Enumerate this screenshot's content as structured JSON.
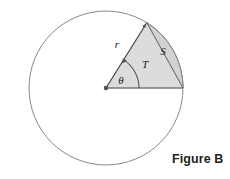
{
  "figure": {
    "caption": "Figure B",
    "caption_position": {
      "left": 172,
      "top": 152
    },
    "background_color": "#ffffff",
    "stroke_color": "#6e6e6e",
    "sector_fill_color": "#dcdcdc",
    "segment_fill_color": "#d2d2d2",
    "label_color": "#1a1a1a",
    "circle": {
      "name": "outer-circle",
      "center_x": 106,
      "center_y": 88,
      "radius": 77,
      "stroke_width": 0.9,
      "fill": "none"
    },
    "center_point": {
      "name": "circle-center-dot",
      "x": 106,
      "y": 88,
      "radius": 2.2
    },
    "sector": {
      "name": "shaded-sector",
      "start_angle_deg": 0,
      "end_angle_deg": 58,
      "apex_x": 146.8,
      "apex_y": 22.7,
      "arc_end_x": 183,
      "arc_end_y": 88
    },
    "labels": [
      {
        "id": "radius",
        "text": "r",
        "x": 120,
        "y": 46
      },
      {
        "id": "segment",
        "text": "S",
        "x": 163,
        "y": 52
      },
      {
        "id": "triangle",
        "text": "T",
        "x": 145,
        "y": 65
      },
      {
        "id": "angle",
        "text": "θ",
        "x": 121,
        "y": 81
      }
    ],
    "arrows": [
      {
        "id": "radius-arrow",
        "points_to": "apex"
      },
      {
        "id": "angle-arc-arrow",
        "points_to": "angle-arc-upper-end"
      }
    ],
    "angle_arc": {
      "name": "theta-angle-arc",
      "radius": 33,
      "start_angle_deg": 0,
      "end_angle_deg": 58
    }
  }
}
